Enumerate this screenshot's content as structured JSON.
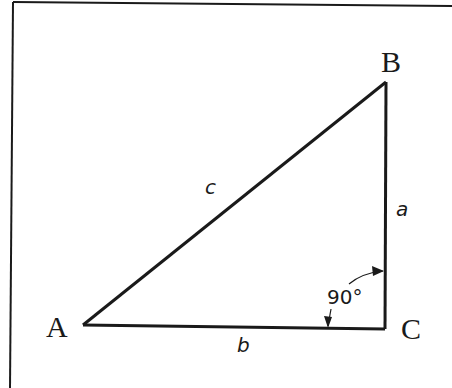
{
  "diagram": {
    "type": "right-triangle",
    "vertices": [
      {
        "id": "A",
        "label": "A"
      },
      {
        "id": "B",
        "label": "B"
      },
      {
        "id": "C",
        "label": "C"
      }
    ],
    "sides": [
      {
        "id": "c",
        "label": "c",
        "between": [
          "A",
          "B"
        ]
      },
      {
        "id": "a",
        "label": "a",
        "between": [
          "B",
          "C"
        ]
      },
      {
        "id": "b",
        "label": "b",
        "between": [
          "A",
          "C"
        ]
      }
    ],
    "angle": {
      "at": "C",
      "label": "90°"
    },
    "colors": {
      "stroke": "#1a1a1a",
      "background": "#ffffff"
    }
  }
}
